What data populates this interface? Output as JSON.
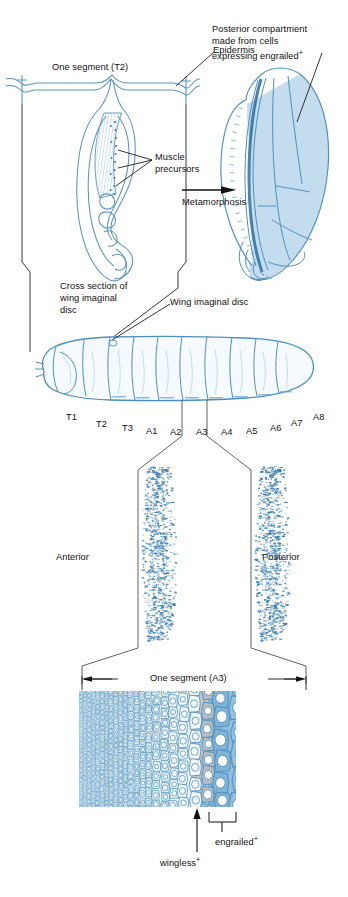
{
  "figure": {
    "title_hidden": "Drosophila larval segment to adult wing compartments",
    "colors": {
      "ink_blue": "#3f7fb0",
      "line_blue": "#5a95c2",
      "pale_blue": "#d7e8f4",
      "mid_blue": "#a9cde6",
      "deep_blue": "#6ca6cf",
      "gray_cell": "#b9bcc0",
      "black": "#111111",
      "background": "#ffffff"
    }
  },
  "panel_top_left": {
    "segment_label": "One segment (T2)",
    "epidermis_label": "Epidermis",
    "muscle_label_line1": "Muscle",
    "muscle_label_line2": "precursors",
    "cross_section_line1": "Cross section of",
    "cross_section_line2": "wing imaginal",
    "cross_section_line3": "disc"
  },
  "panel_top_right": {
    "caption_line1": "Posterior compartment",
    "caption_line2": "made from cells",
    "caption_line3_prefix": "expressing ",
    "caption_line3_gene": "engrailed",
    "caption_line3_sup": "+"
  },
  "transition": {
    "arrow_label": "Metamorphosis"
  },
  "panel_larva": {
    "disc_label": "Wing imaginal disc",
    "segments": [
      {
        "id": "T1",
        "label": "T1",
        "x": 66,
        "y": 412
      },
      {
        "id": "T2",
        "label": "T2",
        "x": 96,
        "y": 419
      },
      {
        "id": "T3",
        "label": "T3",
        "x": 122,
        "y": 423
      },
      {
        "id": "A1",
        "label": "A1",
        "x": 146,
        "y": 426
      },
      {
        "id": "A2",
        "label": "A2",
        "x": 170,
        "y": 427
      },
      {
        "id": "A3",
        "label": "A3",
        "x": 196,
        "y": 427
      },
      {
        "id": "A4",
        "label": "A4",
        "x": 221,
        "y": 427
      },
      {
        "id": "A5",
        "label": "A5",
        "x": 246,
        "y": 426
      },
      {
        "id": "A6",
        "label": "A6",
        "x": 270,
        "y": 423
      },
      {
        "id": "A7",
        "label": "A7",
        "x": 291,
        "y": 418
      },
      {
        "id": "A8",
        "label": "A8",
        "x": 313,
        "y": 412
      }
    ]
  },
  "panel_denticles": {
    "anterior_label": "Anterior",
    "posterior_label": "Posterior"
  },
  "panel_cells": {
    "segment_label": "One segment (A3)",
    "wingless_gene": "wingless",
    "wingless_sup": "+",
    "engrailed_gene": "engrailed",
    "engrailed_sup": "+"
  }
}
